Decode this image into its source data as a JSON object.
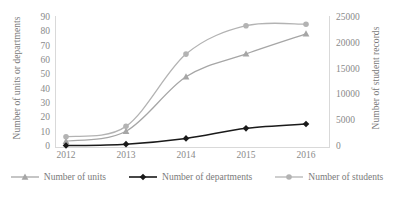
{
  "chart_data": {
    "type": "line",
    "title": "",
    "xlabel": "",
    "categories": [
      "2012",
      "2013",
      "2014",
      "2015",
      "2016"
    ],
    "grid": false,
    "legend_position": "bottom",
    "axes": {
      "left": {
        "label": "Number of units or departments",
        "ticks": [
          0,
          10,
          20,
          30,
          40,
          50,
          60,
          70,
          80,
          90
        ],
        "ylim": [
          0,
          90
        ]
      },
      "right": {
        "label": "Number of student records",
        "ticks": [
          0,
          5000,
          10000,
          15000,
          20000,
          25000
        ],
        "ylim": [
          0,
          25000
        ]
      }
    },
    "series": [
      {
        "name": "Number of units",
        "axis": "left",
        "marker": "triangle",
        "color": "#a6a6a6",
        "values": [
          4,
          11,
          49,
          65,
          79
        ]
      },
      {
        "name": "Number of departments",
        "axis": "left",
        "marker": "diamond",
        "color": "#1a1a1a",
        "values": [
          1,
          2,
          6,
          13,
          16
        ]
      },
      {
        "name": "Number of students",
        "axis": "right",
        "marker": "circle",
        "color": "#b3b3b3",
        "values": [
          2000,
          4000,
          18000,
          23500,
          23800
        ]
      }
    ]
  }
}
